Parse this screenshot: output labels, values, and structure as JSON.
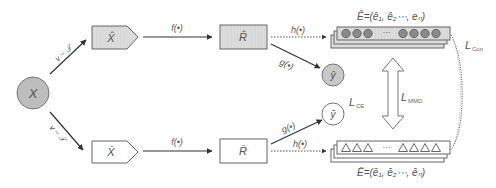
{
  "diagram": {
    "input": {
      "label": "X",
      "fill": "#bdbdbd"
    },
    "augment_top": {
      "edge_label": "v ~ 𝒯",
      "node_label": "X̂",
      "fill": "#dcdcdc"
    },
    "augment_bottom": {
      "edge_label": "v ~ 𝒯",
      "node_label": "X̄",
      "fill": "#ffffff"
    },
    "encoder_top": {
      "edge_label": "f(•)",
      "node_label": "R̂",
      "fill": "#dcdcdc"
    },
    "encoder_bottom": {
      "edge_label": "f(•)",
      "node_label": "R̄",
      "fill": "#ffffff"
    },
    "projection_top": {
      "edge_label": "h(•)",
      "title": "Ê=(ê₁, ê₂⋯, eₙ)",
      "ellipsis": "⋯",
      "marker": "circle",
      "marker_fill": "#8a8a8a"
    },
    "projection_bottom": {
      "edge_label": "h(•)",
      "title": "Ē=(ē₁, ē₂⋯, ēₙ)",
      "ellipsis": "⋯",
      "marker": "triangle"
    },
    "classifier_top": {
      "edge_label": "g(•)",
      "node_label": "ŷ",
      "fill": "#c8c8c8"
    },
    "classifier_bottom": {
      "edge_label": "g(•)",
      "node_label": "ȳ",
      "fill": "#ffffff"
    },
    "losses": {
      "ce": {
        "main": "L",
        "sub": "CE"
      },
      "mmd": {
        "main": "L",
        "sub": "MMD"
      },
      "con": {
        "main": "L",
        "sub": "Con"
      }
    }
  }
}
